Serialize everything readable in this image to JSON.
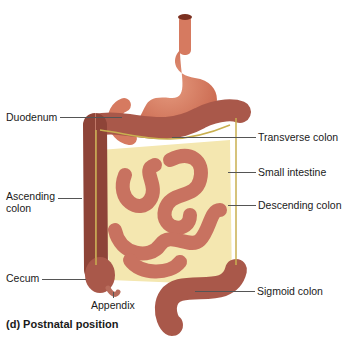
{
  "figure": {
    "caption": "(d) Postnatal position",
    "colors": {
      "organ": "#b8685a",
      "organ_dark": "#8e4438",
      "organ_light": "#d98a74",
      "stomach": "#d67a60",
      "mesentery": "#f4e7b0",
      "vessel": "#c9b050"
    },
    "labels": {
      "duodenum": "Duodenum",
      "ascending_colon_1": "Ascending",
      "ascending_colon_2": "colon",
      "cecum": "Cecum",
      "appendix": "Appendix",
      "transverse_colon": "Transverse colon",
      "small_intestine": "Small intestine",
      "descending_colon": "Descending colon",
      "sigmoid_colon": "Sigmoid colon"
    }
  }
}
